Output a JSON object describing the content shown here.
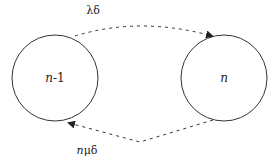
{
  "diagram": {
    "type": "state-transition",
    "colors": {
      "stroke": "#333333",
      "text": "#222222",
      "background": "#ffffff"
    },
    "states": [
      {
        "id": "n-1",
        "label_var": "n",
        "label_suffix": "-1",
        "cx": 55,
        "cy": 78,
        "r": 43
      },
      {
        "id": "n",
        "label_var": "n",
        "label_suffix": "",
        "cx": 224,
        "cy": 78,
        "r": 43
      }
    ],
    "transitions": [
      {
        "from": "n-1",
        "to": "n",
        "style": "dashed",
        "label": "λδ",
        "label_var": "",
        "label_rest": "λδ"
      },
      {
        "from": "n",
        "to": "n-1",
        "style": "dashed",
        "label": "nμδ",
        "label_var": "n",
        "label_rest": "μδ"
      }
    ]
  }
}
